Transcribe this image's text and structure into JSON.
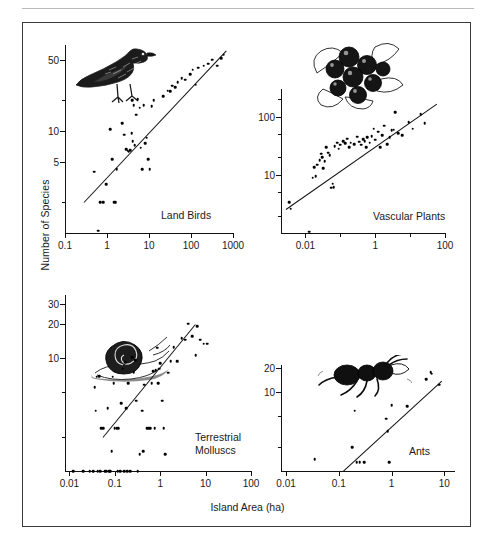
{
  "figure": {
    "axis_titles": {
      "y": "Number of Species",
      "x": "Island Area (ha)"
    }
  },
  "chart_data": [
    {
      "type": "scatter",
      "title": "Land Birds",
      "icon": "bird-illustration",
      "xlabel": "Island Area (ha)",
      "ylabel": "Number of Species",
      "xscale": "log",
      "yscale": "log",
      "xlim": [
        0.1,
        1000
      ],
      "ylim": [
        1,
        70
      ],
      "xticks": [
        0.1,
        1,
        10,
        100,
        1000
      ],
      "xticklabels": [
        "0.1",
        "1",
        "10",
        "100",
        "1000"
      ],
      "yticks": [
        5,
        10,
        50
      ],
      "yticklabels": [
        "5",
        "10",
        "50"
      ],
      "grid": false,
      "legend": "none",
      "fit_line": {
        "x": [
          0.28,
          700
        ],
        "y": [
          2.0,
          62
        ]
      },
      "points": [
        [
          0.5,
          4.0
        ],
        [
          0.62,
          1.05
        ],
        [
          0.7,
          2.0
        ],
        [
          0.8,
          2.0
        ],
        [
          0.95,
          3.0
        ],
        [
          1.2,
          10.5
        ],
        [
          1.35,
          5.3
        ],
        [
          1.5,
          2.0
        ],
        [
          1.62,
          2.0
        ],
        [
          1.7,
          4.2
        ],
        [
          2.3,
          12.0
        ],
        [
          2.6,
          9.2
        ],
        [
          2.9,
          6.6
        ],
        [
          3.1,
          6.4
        ],
        [
          3.3,
          6.3
        ],
        [
          3.6,
          6.5
        ],
        [
          3.9,
          9.6
        ],
        [
          4.0,
          20.0
        ],
        [
          4.1,
          8.0
        ],
        [
          4.3,
          18.0
        ],
        [
          4.6,
          7.3
        ],
        [
          5.0,
          14.5
        ],
        [
          5.4,
          20.5
        ],
        [
          6.0,
          17.0
        ],
        [
          6.4,
          6.9
        ],
        [
          7.0,
          4.2
        ],
        [
          7.5,
          18.0
        ],
        [
          8.2,
          7.6
        ],
        [
          8.8,
          8.6
        ],
        [
          9.5,
          5.3
        ],
        [
          10.5,
          4.2
        ],
        [
          11.5,
          17.5
        ],
        [
          13.0,
          20.0
        ],
        [
          22.0,
          22.0
        ],
        [
          28.0,
          25.0
        ],
        [
          32.0,
          24.5
        ],
        [
          36.0,
          28.0
        ],
        [
          42.0,
          27.0
        ],
        [
          48.0,
          30.0
        ],
        [
          60.0,
          33.0
        ],
        [
          72.0,
          32.0
        ],
        [
          95.0,
          36.0
        ],
        [
          110.0,
          40.0
        ],
        [
          130.0,
          28.5
        ],
        [
          150.0,
          42.0
        ],
        [
          200.0,
          44.0
        ],
        [
          260.0,
          46.0
        ],
        [
          320.0,
          50.0
        ],
        [
          420.0,
          44.0
        ],
        [
          520.0,
          52.0
        ],
        [
          600.0,
          56.0
        ]
      ]
    },
    {
      "type": "scatter",
      "title": "Vascular Plants",
      "icon": "berries-illustration",
      "xlabel": "Island Area (ha)",
      "ylabel": "Number of Species",
      "xscale": "log",
      "yscale": "log",
      "xlim": [
        0.002,
        100
      ],
      "ylim": [
        1,
        300
      ],
      "xticks": [
        0.01,
        1,
        100
      ],
      "xticklabels": [
        "0.01",
        "1",
        "100"
      ],
      "yticks": [
        10,
        100
      ],
      "yticklabels": [
        "10",
        "100"
      ],
      "grid": false,
      "legend": "none",
      "fit_line": {
        "x": [
          0.0028,
          60
        ],
        "y": [
          2.6,
          170
        ]
      },
      "points": [
        [
          0.0035,
          3.4
        ],
        [
          0.0038,
          2.6
        ],
        [
          0.013,
          1.05
        ],
        [
          0.016,
          9.0
        ],
        [
          0.018,
          13.5
        ],
        [
          0.02,
          9.5
        ],
        [
          0.022,
          15.0
        ],
        [
          0.026,
          18.0
        ],
        [
          0.028,
          23.0
        ],
        [
          0.03,
          20.0
        ],
        [
          0.033,
          13.0
        ],
        [
          0.036,
          17.0
        ],
        [
          0.04,
          30.0
        ],
        [
          0.045,
          24.0
        ],
        [
          0.05,
          22.0
        ],
        [
          0.055,
          6.0
        ],
        [
          0.06,
          7.0
        ],
        [
          0.065,
          6.2
        ],
        [
          0.07,
          31.0
        ],
        [
          0.08,
          36.0
        ],
        [
          0.09,
          28.0
        ],
        [
          0.1,
          33.0
        ],
        [
          0.12,
          38.0
        ],
        [
          0.14,
          35.0
        ],
        [
          0.16,
          42.0
        ],
        [
          0.18,
          30.0
        ],
        [
          0.2,
          36.0
        ],
        [
          0.25,
          34.0
        ],
        [
          0.3,
          45.0
        ],
        [
          0.35,
          37.0
        ],
        [
          0.4,
          33.0
        ],
        [
          0.45,
          41.0
        ],
        [
          0.5,
          38.0
        ],
        [
          0.55,
          30.0
        ],
        [
          0.6,
          44.0
        ],
        [
          0.7,
          36.0
        ],
        [
          0.8,
          46.0
        ],
        [
          0.9,
          62.0
        ],
        [
          1.0,
          40.0
        ],
        [
          1.2,
          55.0
        ],
        [
          1.4,
          30.0
        ],
        [
          1.6,
          48.0
        ],
        [
          1.8,
          70.0
        ],
        [
          2.2,
          34.0
        ],
        [
          2.6,
          44.0
        ],
        [
          3.0,
          58.0
        ],
        [
          3.4,
          60.0
        ],
        [
          3.8,
          120.0
        ],
        [
          4.5,
          52.0
        ],
        [
          6.0,
          48.0
        ],
        [
          9.0,
          80.0
        ],
        [
          12.0,
          62.0
        ],
        [
          20.0,
          110.0
        ],
        [
          26.0,
          78.0
        ]
      ]
    },
    {
      "type": "scatter",
      "title": "Terrestrial\nMolluscs",
      "icon": "snail-illustration",
      "xlabel": "Island Area (ha)",
      "ylabel": "Number of Species",
      "xscale": "log",
      "yscale": "log",
      "xlim": [
        0.008,
        100
      ],
      "ylim": [
        1,
        36
      ],
      "xticks": [
        0.01,
        0.1,
        1,
        10,
        100
      ],
      "xticklabels": [
        "0.01",
        "0.1",
        "1",
        "10",
        "100"
      ],
      "yticks": [
        10,
        20,
        30
      ],
      "yticklabels": [
        "10",
        "20",
        "30"
      ],
      "grid": false,
      "legend": "none",
      "fit_line": {
        "x": [
          0.055,
          6.0
        ],
        "y": [
          2.0,
          20.0
        ]
      },
      "points": [
        [
          0.012,
          1.0
        ],
        [
          0.02,
          1.0
        ],
        [
          0.028,
          1.0
        ],
        [
          0.033,
          1.0
        ],
        [
          0.036,
          5.5
        ],
        [
          0.038,
          3.4
        ],
        [
          0.04,
          6.8
        ],
        [
          0.042,
          1.0
        ],
        [
          0.045,
          6.9
        ],
        [
          0.048,
          1.0
        ],
        [
          0.05,
          2.4
        ],
        [
          0.055,
          2.4
        ],
        [
          0.06,
          1.0
        ],
        [
          0.065,
          1.0
        ],
        [
          0.07,
          3.6
        ],
        [
          0.075,
          1.0
        ],
        [
          0.08,
          1.0
        ],
        [
          0.085,
          1.5
        ],
        [
          0.09,
          6.8
        ],
        [
          0.095,
          6.0
        ],
        [
          0.1,
          2.4
        ],
        [
          0.11,
          2.4
        ],
        [
          0.115,
          1.0
        ],
        [
          0.12,
          2.4
        ],
        [
          0.13,
          1.0
        ],
        [
          0.14,
          4.0
        ],
        [
          0.15,
          8.0
        ],
        [
          0.16,
          1.0
        ],
        [
          0.17,
          9.2
        ],
        [
          0.18,
          3.6
        ],
        [
          0.19,
          1.0
        ],
        [
          0.2,
          6.0
        ],
        [
          0.22,
          1.0
        ],
        [
          0.24,
          10.2
        ],
        [
          0.26,
          7.5
        ],
        [
          0.28,
          9.5
        ],
        [
          0.3,
          4.2
        ],
        [
          0.32,
          1.0
        ],
        [
          0.35,
          1.4
        ],
        [
          0.4,
          3.4
        ],
        [
          0.42,
          1.5
        ],
        [
          0.45,
          5.8
        ],
        [
          0.5,
          2.4
        ],
        [
          0.55,
          2.4
        ],
        [
          0.6,
          2.4
        ],
        [
          0.65,
          6.0
        ],
        [
          0.7,
          7.6
        ],
        [
          0.75,
          2.4
        ],
        [
          0.8,
          7.8
        ],
        [
          0.85,
          12.3
        ],
        [
          0.9,
          6.0
        ],
        [
          0.95,
          8.0
        ],
        [
          1.0,
          9.0
        ],
        [
          1.1,
          4.2
        ],
        [
          1.2,
          2.4
        ],
        [
          1.3,
          1.4
        ],
        [
          1.5,
          7.4
        ],
        [
          1.7,
          9.4
        ],
        [
          2.0,
          12.5
        ],
        [
          2.4,
          9.4
        ],
        [
          3.0,
          15.0
        ],
        [
          3.6,
          14.5
        ],
        [
          4.2,
          20.0
        ],
        [
          5.0,
          15.5
        ],
        [
          6.0,
          10.6
        ],
        [
          6.5,
          19.0
        ],
        [
          7.5,
          14.5
        ],
        [
          9.0,
          13.4
        ],
        [
          11.0,
          13.4
        ]
      ]
    },
    {
      "type": "scatter",
      "title": "Ants",
      "icon": "ant-illustration",
      "xlabel": "Island Area (ha)",
      "ylabel": "Number of Species",
      "xscale": "log",
      "yscale": "log",
      "xlim": [
        0.008,
        16
      ],
      "ylim": [
        1,
        22
      ],
      "xticks": [
        0.01,
        0.1,
        1,
        10
      ],
      "xticklabels": [
        "0.01",
        "0.1",
        "1",
        "10"
      ],
      "yticks": [
        10,
        20
      ],
      "yticklabels": [
        "10",
        "20"
      ],
      "grid": false,
      "legend": "none",
      "fit_line": {
        "x": [
          0.12,
          9.0
        ],
        "y": [
          1.0,
          14.0
        ]
      },
      "points": [
        [
          0.035,
          1.4
        ],
        [
          0.18,
          2.0
        ],
        [
          0.2,
          5.8
        ],
        [
          0.22,
          1.3
        ],
        [
          0.25,
          1.3
        ],
        [
          0.3,
          1.3
        ],
        [
          0.8,
          4.6
        ],
        [
          0.85,
          3.2
        ],
        [
          0.9,
          1.3
        ],
        [
          1.0,
          6.8
        ],
        [
          2.0,
          6.6
        ],
        [
          4.5,
          14.6
        ],
        [
          5.5,
          17.8
        ],
        [
          5.8,
          17.0
        ],
        [
          8.0,
          12.4
        ]
      ]
    }
  ]
}
